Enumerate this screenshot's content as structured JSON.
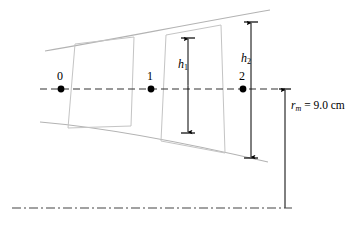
{
  "figure": {
    "name": "turbomachinery-annulus-meridional-diagram",
    "width": 362,
    "height": 235,
    "background_color": "#ffffff",
    "duct_line_color": "#b3b3b3",
    "blade_line_color": "#c0c0c0",
    "annotation_color": "#000000",
    "centerline_color": "#333333"
  },
  "stations": [
    {
      "label": "0",
      "x": 61,
      "y": 89,
      "label_x": 57,
      "label_y": 70
    },
    {
      "label": "1",
      "x": 151,
      "y": 89,
      "label_x": 147,
      "label_y": 70
    },
    {
      "label": "2",
      "x": 243,
      "y": 89,
      "label_x": 239,
      "label_y": 70
    }
  ],
  "dimensions": [
    {
      "id": "h1",
      "symbol": "h",
      "subscript": "1",
      "x": 188,
      "top_y": 38,
      "bottom_y": 133,
      "label_x": 178,
      "label_y": 58
    },
    {
      "id": "h2",
      "symbol": "h",
      "subscript": "2",
      "x": 251,
      "top_y": 22,
      "bottom_y": 158,
      "label_x": 241,
      "label_y": 52
    }
  ],
  "radius_annotation": {
    "variable": "r",
    "subscript": "m",
    "equals": " = ",
    "value": "9.0",
    "unit": "cm",
    "full_text": "r_m = 9.0 cm",
    "line_x": 285,
    "top_y": 89,
    "bottom_y": 208,
    "label_x": 291,
    "label_y": 100
  },
  "centerline": {
    "y": 89,
    "x_start": 40,
    "x_end": 285,
    "style": "dashed"
  },
  "axis_line": {
    "y": 208,
    "x_start": 12,
    "x_end": 292,
    "style": "dash-dot"
  },
  "casing_upper": {
    "description": "outer casing curve rising to the right",
    "path": "M 45,51 C 110,40 190,24 270,10"
  },
  "hub_lower": {
    "description": "inner hub curve falling to the right",
    "path": "M 40,122 C 110,128 195,145 268,162"
  },
  "blade_rows": [
    {
      "id": "blade-row-1",
      "path": "M 75,44 L 68,128 L 131,126 L 134,37 Z"
    },
    {
      "id": "blade-row-2",
      "path": "M 166,35 L 161,141 L 225,153 L 221,25 Z"
    }
  ]
}
